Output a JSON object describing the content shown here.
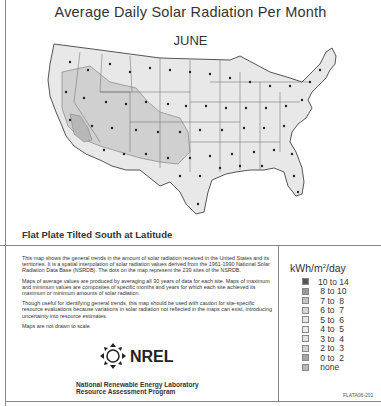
{
  "header": {
    "title": "Average Daily Solar Radiation Per Month",
    "month": "JUNE"
  },
  "map": {
    "subtitle": "Flat Plate Tilted South at Latitude",
    "region": "United States (contiguous)",
    "site_marker": "dot"
  },
  "description": {
    "paragraphs": [
      "This map shows the general trends in the amount of solar radiation received in the United States and its territories. It is a spatial interpolation of solar radiation values derived from the 1961-1990 National Solar Radiation Data Base (NSRDB). The dots on the map represent the 239 sites of the NSRDB.",
      "Maps of average values are produced by averaging all 30 years of data for each site. Maps of maximum and minimum values are composites of specific months and years for which each site achieved its maximum or minimum amounts of solar radiation.",
      "Though useful for identifying general trends, this map should be used with caution for site-specific resource evaluations because variations in solar radiation not reflected in the maps can exist, introducing uncertainty into resource estimates.",
      "Maps are not drawn to scale."
    ]
  },
  "organization": {
    "logo_text": "NREL",
    "line1": "National Renewable Energy Laboratory",
    "line2": "Resource Assessment Program"
  },
  "legend": {
    "unit": "kWh/m",
    "unit_sup": "2",
    "unit_suffix": "/day",
    "items": [
      {
        "label": "10 to 14",
        "color": "#555555"
      },
      {
        "label": " 8 to 10",
        "color": "#9a9a9a"
      },
      {
        "label": " 7 to  8",
        "color": "#c4c4c4"
      },
      {
        "label": " 6 to  7",
        "color": "#d8d8d8"
      },
      {
        "label": " 5 to  6",
        "color": "#e6e6e6"
      },
      {
        "label": " 4 to  5",
        "color": "#ececec"
      },
      {
        "label": " 3 to  4",
        "color": "#e2e2e2"
      },
      {
        "label": " 2 to  3",
        "color": "#d2d2d2"
      },
      {
        "label": " 0 to  2",
        "color": "#a6a6a6"
      },
      {
        "label": " none",
        "color": "#b8b8b8"
      }
    ]
  },
  "footer": {
    "code": "FLATA06-201"
  },
  "colors": {
    "region_6_to_7": "#d0d0d0",
    "region_5_to_6": "#e8e8e8",
    "border": "#555555"
  }
}
